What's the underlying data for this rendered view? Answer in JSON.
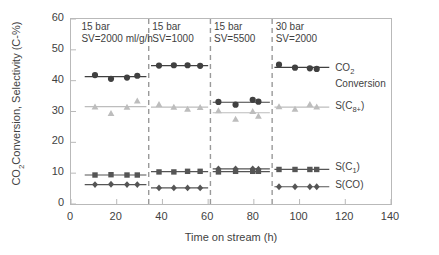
{
  "chart_data": {
    "type": "scatter",
    "title": "",
    "xlabel": "Time on stream  (h)",
    "ylabel": "CO2Conversion,  Selectivity (C-%)",
    "ylabel_main": "CO",
    "ylabel_sub": "2",
    "ylabel_rest": "Conversion,  Selectivity (C-%)",
    "xlim": [
      0,
      140
    ],
    "ylim": [
      0,
      60
    ],
    "xticks": [
      0,
      20,
      40,
      60,
      80,
      100,
      120,
      140
    ],
    "yticks": [
      0,
      10,
      20,
      30,
      40,
      50,
      60
    ],
    "grid": false,
    "legend_position": "right-outside",
    "segment_dividers": [
      34,
      61,
      88
    ],
    "annotations": [
      {
        "pressure": "15 bar",
        "sv": "SV=2000 ml/g/h",
        "x": 5
      },
      {
        "pressure": "15 bar",
        "sv": "SV=1000",
        "x": 36
      },
      {
        "pressure": "15 bar",
        "sv": "SV=5500",
        "x": 63
      },
      {
        "pressure": "30 bar",
        "sv": "SV=2000",
        "x": 90
      }
    ],
    "series": [
      {
        "name": "CO2 Conversion",
        "legend_label_main": "CO",
        "legend_label_sub": "2",
        "legend_label_second": "Conversion",
        "marker": "circle",
        "color": "#404040",
        "points": [
          {
            "x": 10.5,
            "y": 41.8
          },
          {
            "x": 17.5,
            "y": 40.6
          },
          {
            "x": 24.5,
            "y": 41.0
          },
          {
            "x": 29.0,
            "y": 41.6
          },
          {
            "x": 38.5,
            "y": 44.9
          },
          {
            "x": 45.0,
            "y": 45.0
          },
          {
            "x": 51.0,
            "y": 45.0
          },
          {
            "x": 56.5,
            "y": 44.8
          },
          {
            "x": 64.5,
            "y": 33.1
          },
          {
            "x": 72.0,
            "y": 32.2
          },
          {
            "x": 79.5,
            "y": 33.8
          },
          {
            "x": 82.0,
            "y": 33.2
          },
          {
            "x": 91.0,
            "y": 45.2
          },
          {
            "x": 98.0,
            "y": 44.2
          },
          {
            "x": 104.5,
            "y": 44.0
          },
          {
            "x": 107.5,
            "y": 43.8
          }
        ],
        "trend_segments": [
          {
            "x0": 6,
            "x1": 33,
            "y": 41.3
          },
          {
            "x0": 35,
            "x1": 60,
            "y": 44.9
          },
          {
            "x0": 62,
            "x1": 87,
            "y": 33.0
          },
          {
            "x0": 89,
            "x1": 113,
            "y": 44.3
          }
        ]
      },
      {
        "name": "S(C8+)",
        "legend_label_main": "S(C",
        "legend_label_sub": "8+",
        "legend_label_end": ")",
        "marker": "triangle",
        "color": "#bdbdbd",
        "points": [
          {
            "x": 10.5,
            "y": 31.5
          },
          {
            "x": 17.5,
            "y": 29.4
          },
          {
            "x": 24.5,
            "y": 31.4
          },
          {
            "x": 29.0,
            "y": 33.4
          },
          {
            "x": 38.5,
            "y": 32.3
          },
          {
            "x": 45.0,
            "y": 31.4
          },
          {
            "x": 51.0,
            "y": 30.8
          },
          {
            "x": 56.5,
            "y": 31.3
          },
          {
            "x": 64.5,
            "y": 30.3
          },
          {
            "x": 72.0,
            "y": 27.5
          },
          {
            "x": 79.5,
            "y": 30.0
          },
          {
            "x": 82.0,
            "y": 28.5
          },
          {
            "x": 91.0,
            "y": 31.6
          },
          {
            "x": 98.0,
            "y": 30.8
          },
          {
            "x": 104.5,
            "y": 32.3
          },
          {
            "x": 107.5,
            "y": 31.5
          }
        ],
        "trend_segments": [
          {
            "x0": 6,
            "x1": 33,
            "y": 31.6
          },
          {
            "x0": 35,
            "x1": 60,
            "y": 31.4
          },
          {
            "x0": 62,
            "x1": 87,
            "y": 29.6
          },
          {
            "x0": 89,
            "x1": 113,
            "y": 31.4
          }
        ]
      },
      {
        "name": "S(C1)",
        "legend_label_main": "S(C",
        "legend_label_sub": "1",
        "legend_label_end": ")",
        "marker": "square",
        "color": "#555555",
        "points": [
          {
            "x": 10.5,
            "y": 9.4
          },
          {
            "x": 17.5,
            "y": 9.5
          },
          {
            "x": 24.5,
            "y": 9.4
          },
          {
            "x": 29.0,
            "y": 9.4
          },
          {
            "x": 38.5,
            "y": 10.4
          },
          {
            "x": 45.0,
            "y": 10.4
          },
          {
            "x": 51.0,
            "y": 10.6
          },
          {
            "x": 56.5,
            "y": 10.6
          },
          {
            "x": 64.5,
            "y": 10.4
          },
          {
            "x": 72.0,
            "y": 10.6
          },
          {
            "x": 79.5,
            "y": 10.6
          },
          {
            "x": 82.0,
            "y": 10.6
          },
          {
            "x": 91.0,
            "y": 11.2
          },
          {
            "x": 98.0,
            "y": 11.2
          },
          {
            "x": 104.5,
            "y": 11.2
          },
          {
            "x": 107.5,
            "y": 11.2
          }
        ],
        "trend_segments": [
          {
            "x0": 6,
            "x1": 33,
            "y": 9.4
          },
          {
            "x0": 35,
            "x1": 60,
            "y": 10.5
          },
          {
            "x0": 62,
            "x1": 87,
            "y": 10.5
          },
          {
            "x0": 89,
            "x1": 113,
            "y": 11.2
          }
        ]
      },
      {
        "name": "S(CO)",
        "legend_label_main": "S(CO)",
        "marker": "diamond",
        "color": "#555555",
        "points": [
          {
            "x": 10.5,
            "y": 6.3
          },
          {
            "x": 17.5,
            "y": 6.4
          },
          {
            "x": 24.5,
            "y": 6.3
          },
          {
            "x": 29.0,
            "y": 6.3
          },
          {
            "x": 38.5,
            "y": 5.2
          },
          {
            "x": 45.0,
            "y": 5.2
          },
          {
            "x": 51.0,
            "y": 5.2
          },
          {
            "x": 56.5,
            "y": 5.2
          },
          {
            "x": 64.5,
            "y": 11.4
          },
          {
            "x": 72.0,
            "y": 11.4
          },
          {
            "x": 79.5,
            "y": 11.4
          },
          {
            "x": 82.0,
            "y": 11.3
          },
          {
            "x": 91.0,
            "y": 5.6
          },
          {
            "x": 98.0,
            "y": 5.6
          },
          {
            "x": 104.5,
            "y": 5.6
          },
          {
            "x": 107.5,
            "y": 5.6
          }
        ],
        "trend_segments": [
          {
            "x0": 6,
            "x1": 33,
            "y": 6.3
          },
          {
            "x0": 35,
            "x1": 60,
            "y": 5.2
          },
          {
            "x0": 62,
            "x1": 87,
            "y": 11.4
          },
          {
            "x0": 89,
            "x1": 113,
            "y": 5.6
          }
        ]
      }
    ],
    "legend_entries": [
      {
        "label": "CO2 Conversion",
        "y": 43.5
      },
      {
        "label": "S(C8+)",
        "y": 31.0
      },
      {
        "label": "S(C1)",
        "y": 11.2
      },
      {
        "label": "S(CO)",
        "y": 5.6
      }
    ]
  }
}
